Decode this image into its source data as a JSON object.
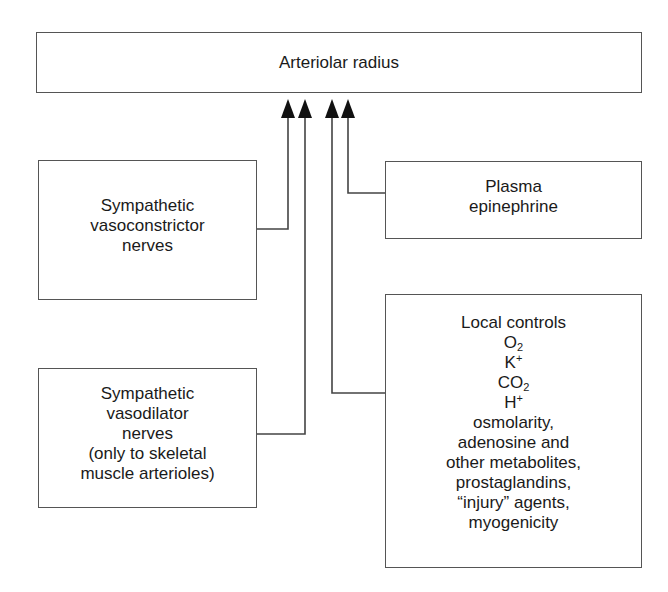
{
  "diagram": {
    "target": {
      "label": "Arteriolar radius"
    },
    "inputs": [
      {
        "id": "sympathetic-vasoconstrictor",
        "lines": [
          "Sympathetic",
          "vasoconstrictor",
          "nerves"
        ]
      },
      {
        "id": "plasma-epinephrine",
        "lines": [
          "Plasma",
          "epinephrine"
        ]
      },
      {
        "id": "sympathetic-vasodilator",
        "lines": [
          "Sympathetic",
          "vasodilator",
          "nerves",
          "(only to skeletal",
          "muscle arterioles)"
        ]
      },
      {
        "id": "local-controls",
        "title": "Local controls",
        "items": [
          {
            "base": "O",
            "sub": "2",
            "sup": ""
          },
          {
            "base": "K",
            "sub": "",
            "sup": "+"
          },
          {
            "base": "CO",
            "sub": "2",
            "sup": ""
          },
          {
            "base": "H",
            "sub": "",
            "sup": "+"
          }
        ],
        "lines": [
          "osmolarity,",
          "adenosine and",
          "other metabolites,",
          "prostaglandins,",
          "“injury” agents,",
          "myogenicity"
        ]
      }
    ],
    "edges": [
      {
        "from": "sympathetic-vasoconstrictor",
        "to": "target"
      },
      {
        "from": "sympathetic-vasodilator",
        "to": "target"
      },
      {
        "from": "local-controls",
        "to": "target"
      },
      {
        "from": "plasma-epinephrine",
        "to": "target"
      }
    ],
    "colors": {
      "stroke": "#555555",
      "arrow": "#111111",
      "text": "#1a1a1a",
      "background": "#ffffff"
    }
  }
}
